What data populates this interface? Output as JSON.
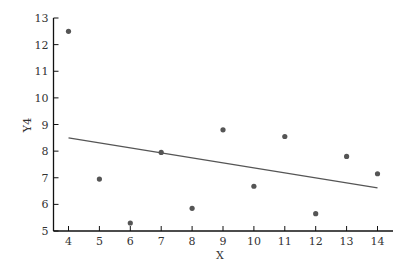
{
  "chart_data": {
    "type": "scatter",
    "title": "",
    "xlabel": "X",
    "ylabel": "Y4",
    "xlim": [
      3.5,
      14.5
    ],
    "ylim": [
      5,
      13
    ],
    "xticks": [
      4,
      5,
      6,
      7,
      8,
      9,
      10,
      11,
      12,
      13,
      14
    ],
    "yticks": [
      5,
      6,
      7,
      8,
      9,
      10,
      11,
      12,
      13
    ],
    "grid": false,
    "legend": null,
    "series": [
      {
        "name": "Y4",
        "kind": "scatter",
        "x": [
          4,
          5,
          6,
          7,
          8,
          9,
          10,
          11,
          12,
          13,
          14
        ],
        "y": [
          12.5,
          6.95,
          5.3,
          7.95,
          5.85,
          8.8,
          6.68,
          8.55,
          5.65,
          7.8,
          7.15
        ]
      },
      {
        "name": "fit",
        "kind": "line",
        "x": [
          4,
          14
        ],
        "y": [
          8.5,
          6.62
        ]
      }
    ]
  },
  "colors": {
    "axis": "#111111",
    "point": "#555555",
    "line": "#555555",
    "text": "#333333"
  }
}
